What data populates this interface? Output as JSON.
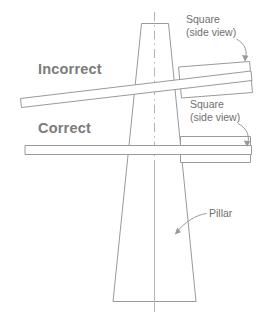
{
  "diagram": {
    "labels": {
      "incorrect": "Incorrect",
      "correct": "Correct",
      "square_top_line1": "Square",
      "square_top_line2": "(side view)",
      "square_bottom_line1": "Square",
      "square_bottom_line2": "(side view)",
      "pillar": "Pillar"
    },
    "colors": {
      "stroke": "#9a9a9a",
      "centerline": "#b5b5b5",
      "text": "#6f6f6f",
      "verdict_text": "#7b7b7b",
      "background": "#ffffff"
    },
    "elements": [
      {
        "name": "pillar",
        "description": "tapered vertical pillar, side view"
      },
      {
        "name": "pillar-centerline",
        "description": "dash-dot vertical axis"
      },
      {
        "name": "incorrect-level-bar",
        "description": "tilted straightedge resting across pillar"
      },
      {
        "name": "incorrect-square",
        "description": "tilted square side view block"
      },
      {
        "name": "correct-level-bar",
        "description": "horizontal straightedge across pillar"
      },
      {
        "name": "correct-square",
        "description": "level square side view block"
      }
    ]
  }
}
